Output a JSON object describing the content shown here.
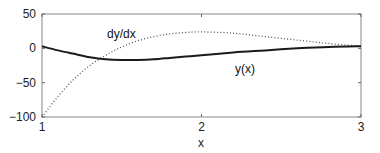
{
  "chart_data": {
    "type": "line",
    "title": "",
    "xlabel": "x",
    "ylabel": "",
    "xlim": [
      1,
      3
    ],
    "ylim": [
      -100,
      50
    ],
    "x_ticks": [
      1,
      2,
      3
    ],
    "y_ticks": [
      50,
      0,
      -50,
      -100
    ],
    "x_tick_labels": [
      "1",
      "2",
      "3"
    ],
    "y_tick_labels": [
      "50",
      "0",
      "−50",
      "−100"
    ],
    "grid": false,
    "legend": null,
    "x": [
      1.0,
      1.1,
      1.2,
      1.3,
      1.4,
      1.5,
      1.6,
      1.7,
      1.8,
      1.9,
      2.0,
      2.2,
      2.4,
      2.6,
      2.8,
      3.0
    ],
    "series": [
      {
        "name": "y(x)",
        "style": "solid",
        "color": "#1a1a1a",
        "values": [
          3,
          -3,
          -8,
          -13,
          -16,
          -17,
          -17,
          -16,
          -14,
          -12,
          -10,
          -6,
          -3,
          0,
          2,
          3
        ]
      },
      {
        "name": "dy/dx",
        "style": "dotted",
        "color": "#555555",
        "values": [
          -100,
          -70,
          -45,
          -25,
          -10,
          2,
          11,
          17,
          21,
          23,
          24,
          22,
          17,
          12,
          7,
          3
        ]
      }
    ],
    "annotations": [
      {
        "text": "dy/dx",
        "x": 1.5,
        "y": 32
      },
      {
        "text": "y(x)",
        "x": 2.4,
        "y": -21
      }
    ]
  }
}
